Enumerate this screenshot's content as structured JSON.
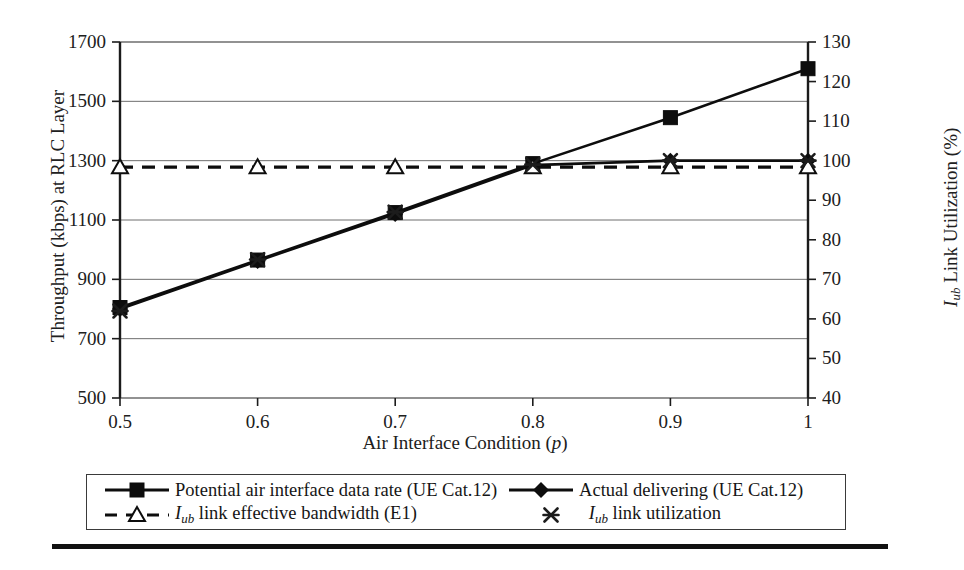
{
  "figure": {
    "axis_left_title_parts": [
      "Throughput (kbps) at RLC Layer"
    ],
    "axis_right_title_main": " Link Utilization (%)",
    "axis_right_title_sym": "I",
    "axis_right_title_sub": "ub",
    "axis_x_title": "Air Interface Condition (",
    "axis_x_title_sym": "p",
    "axis_x_title_end": ")"
  },
  "legend": {
    "entries": [
      {
        "marker": "square",
        "line": "solid",
        "label": "Potential air interface data rate (UE Cat.12)"
      },
      {
        "marker": "diamond",
        "line": "solid",
        "label": "Actual  delivering (UE Cat.12)"
      },
      {
        "marker": "triangle",
        "line": "dashed",
        "label_pre": "I",
        "label_sub": "ub",
        "label": " link effective bandwidth (E1)"
      },
      {
        "marker": "cross",
        "line": "none",
        "label_pre": "I",
        "label_sub": "ub",
        "label": " link utilization"
      }
    ]
  },
  "chart_data": {
    "type": "line",
    "title": "",
    "xlabel": "Air Interface Condition (p)",
    "ylabel": "Throughput (kbps) at RLC Layer",
    "y2label": "Iub Link Utilization (%)",
    "x": [
      0.5,
      0.6,
      0.7,
      0.8,
      0.9,
      1.0
    ],
    "xtick_labels": [
      "0.5",
      "0.6",
      "0.7",
      "0.8",
      "0.9",
      "1"
    ],
    "xlim": [
      0.5,
      1.0
    ],
    "ylim": [
      500,
      1700
    ],
    "ytick_labels": [
      "500",
      "700",
      "900",
      "1100",
      "1300",
      "1500",
      "1700"
    ],
    "yticks": [
      500,
      700,
      900,
      1100,
      1300,
      1500,
      1700
    ],
    "y2lim": [
      40,
      130
    ],
    "y2tick_labels": [
      "40",
      "50",
      "60",
      "70",
      "80",
      "90",
      "100",
      "110",
      "120",
      "130"
    ],
    "y2ticks": [
      40,
      50,
      60,
      70,
      80,
      90,
      100,
      110,
      120,
      130
    ],
    "grid": "horizontal",
    "legend_position": "below-plot",
    "series": [
      {
        "name": "Potential air interface data rate (UE Cat.12)",
        "axis": "left",
        "marker": "square",
        "line": "solid",
        "values": [
          805,
          965,
          1125,
          1290,
          1445,
          1610
        ]
      },
      {
        "name": "Actual  delivering (UE Cat.12)",
        "axis": "left",
        "marker": "diamond",
        "line": "solid",
        "values": [
          800,
          962,
          1120,
          1285,
          1300,
          1300
        ]
      },
      {
        "name": "Iub link effective bandwidth (E1)",
        "axis": "left",
        "marker": "triangle",
        "line": "dashed",
        "values": [
          1278,
          1278,
          1278,
          1278,
          1278,
          1278
        ]
      },
      {
        "name": "Iub link utilization",
        "axis": "right",
        "marker": "cross",
        "line": "none",
        "values": [
          62,
          75,
          87,
          99,
          100,
          100
        ]
      }
    ]
  }
}
